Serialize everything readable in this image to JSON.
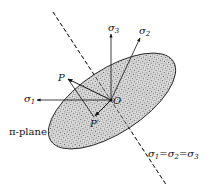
{
  "diagram": {
    "colors": {
      "ink": "#111111",
      "ellipse_fill": "#c8c8c8",
      "background": "#ffffff"
    },
    "labels": {
      "sigma3": {
        "base": "σ",
        "sub": "3"
      },
      "sigma2": {
        "base": "σ",
        "sub": "2"
      },
      "sigma1": {
        "base": "σ",
        "sub": "1"
      },
      "point_P": "P",
      "point_P_prime": "P′",
      "origin": "O",
      "plane": "π-plane",
      "hydrostatic_axis": {
        "parts": [
          "σ",
          "1",
          "=σ",
          "2",
          "=σ",
          "3"
        ]
      }
    },
    "elements": [
      "hydrostatic-axis (dashed line σ1=σ2=σ3)",
      "π-plane (stippled ellipse)",
      "σ1 axis arrow",
      "σ2 axis arrow",
      "σ3 axis arrow",
      "OP vector",
      "OP′ vector (projection)",
      "PP′ line"
    ]
  }
}
